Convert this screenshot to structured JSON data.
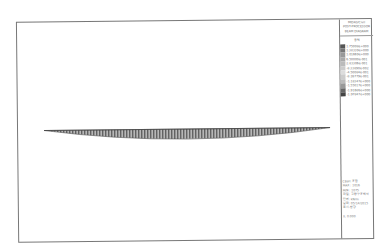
{
  "legend": {
    "header_lines": [
      "MIDAS/Civil",
      "POST-PROCESSOR",
      "BEAM DIAGRAM"
    ],
    "unit": "응력",
    "values": [
      "1.75008e+000",
      "1.38339e+000",
      "1.01669e+000",
      "6.50000e-001",
      "2.83306e-001",
      "-8.33890e-002",
      "-4.50084e-001",
      "-8.16779e-001",
      "-1.18347e+000",
      "-1.55017e+000",
      "-1.91686e+000",
      "-1.97847e+000"
    ],
    "colors": [
      "#555555",
      "#777777",
      "#999999",
      "#aaaaaa",
      "#bbbbbb",
      "#cccccc",
      "#dddddd",
      "#cccccc",
      "#bbbbbb",
      "#999999",
      "#666666",
      "#444444"
    ]
  },
  "info": {
    "lines": [
      "CBall: 조합",
      "MAX : 1016",
      "MIN : 1075",
      "파일: 교량구조해석",
      "단위: kN/m",
      "날짜: 05/14/2015",
      "표시-방향",
      "",
      "X: 0.000"
    ]
  },
  "beam": {
    "description": "beam stress diagram",
    "color": "#6a6a6a"
  }
}
